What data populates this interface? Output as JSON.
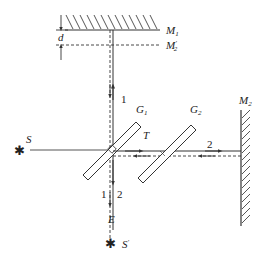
{
  "diagram": {
    "type": "Michelson interferometer schematic",
    "labels": {
      "mirror_1": "M",
      "mirror_1_sub": "1",
      "virtual_mirror_2": "M",
      "virtual_mirror_2_sub": "2",
      "virtual_mirror_2_prime": "′",
      "mirror_2": "M",
      "mirror_2_sub": "2",
      "gap": "d",
      "source": "S",
      "image_source": "S",
      "image_source_prime": "′",
      "beam_splitter": "G",
      "beam_splitter_sub": "1",
      "compensator": "G",
      "compensator_sub": "2",
      "coating": "T",
      "eye": "E",
      "beam_1_upper": "1",
      "beam_2_right": "2",
      "beam_1_lower": "1",
      "beam_2_lower": "2"
    },
    "colors": {
      "line": "#333333",
      "background": "#ffffff"
    }
  }
}
